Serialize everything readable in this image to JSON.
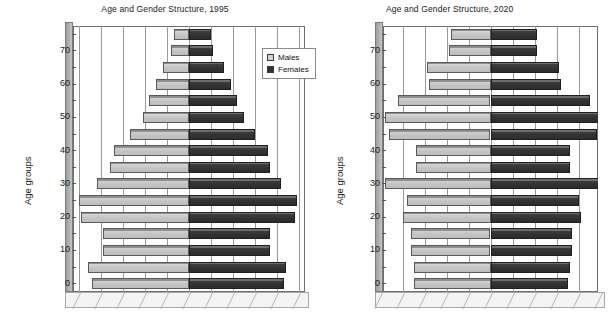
{
  "charts": [
    {
      "id": "chart-1995",
      "title": "Age and Gender Structure, 1995",
      "ylabel": "Age groups",
      "legend": {
        "position": "top-right",
        "males": "Males",
        "females": "Females"
      },
      "ytick_labels": [
        "0",
        "10",
        "20",
        "30",
        "40",
        "50",
        "60",
        "70"
      ]
    },
    {
      "id": "chart-2020",
      "title": "Age and Gender Structure,  2020",
      "ylabel": "Age groups",
      "ytick_labels": [
        "0",
        "10",
        "20",
        "30",
        "40",
        "50",
        "60",
        "70"
      ]
    }
  ],
  "colors": {
    "males": "#c4c4c4",
    "females": "#333333",
    "grid": "#9a9a9a",
    "frame": "#6e6e6e",
    "text": "#1a1a1a"
  },
  "chart_data": [
    {
      "type": "bar",
      "subtype": "population-pyramid",
      "title": "Age and Gender Structure, 1995",
      "xlabel": "",
      "ylabel": "Age groups",
      "categories": [
        "0",
        "5",
        "10",
        "15",
        "20",
        "25",
        "30",
        "35",
        "40",
        "45",
        "50",
        "55",
        "60",
        "65",
        "70",
        "75"
      ],
      "ytick_labels": [
        "0",
        "10",
        "20",
        "30",
        "40",
        "50",
        "60",
        "70"
      ],
      "xlim": [
        -5,
        5
      ],
      "grid": true,
      "legend": [
        "Males",
        "Females"
      ],
      "legend_position": "top-right",
      "series": [
        {
          "name": "Males",
          "side": "left",
          "values": [
            4.4,
            4.6,
            3.9,
            3.9,
            4.9,
            5.0,
            4.2,
            3.6,
            3.4,
            2.7,
            2.1,
            1.8,
            1.5,
            1.2,
            0.8,
            0.7
          ]
        },
        {
          "name": "Females",
          "side": "right",
          "values": [
            4.3,
            4.4,
            3.7,
            3.7,
            4.8,
            4.9,
            4.2,
            3.7,
            3.6,
            3.0,
            2.5,
            2.2,
            1.9,
            1.6,
            1.1,
            1.0
          ]
        }
      ]
    },
    {
      "type": "bar",
      "subtype": "population-pyramid",
      "title": "Age and Gender Structure,  2020",
      "xlabel": "",
      "ylabel": "Age groups",
      "categories": [
        "0",
        "5",
        "10",
        "15",
        "20",
        "25",
        "30",
        "35",
        "40",
        "45",
        "50",
        "55",
        "60",
        "65",
        "70",
        "75"
      ],
      "ytick_labels": [
        "0",
        "10",
        "20",
        "30",
        "40",
        "50",
        "60",
        "70"
      ],
      "xlim": [
        -5,
        5
      ],
      "grid": true,
      "note": "right chart is cropped at the image edge; female bars extend beyond the visible area",
      "series": [
        {
          "name": "Males",
          "side": "left",
          "values": [
            3.5,
            3.5,
            3.6,
            3.6,
            4.0,
            3.8,
            4.8,
            3.4,
            3.4,
            4.6,
            4.8,
            4.2,
            2.8,
            2.9,
            1.9,
            1.8
          ]
        },
        {
          "name": "Females",
          "side": "right",
          "values": [
            3.5,
            3.6,
            3.7,
            3.7,
            4.1,
            4.0,
            5.0,
            3.6,
            3.6,
            4.8,
            5.0,
            4.5,
            3.2,
            3.1,
            2.1,
            2.1
          ]
        }
      ]
    }
  ]
}
